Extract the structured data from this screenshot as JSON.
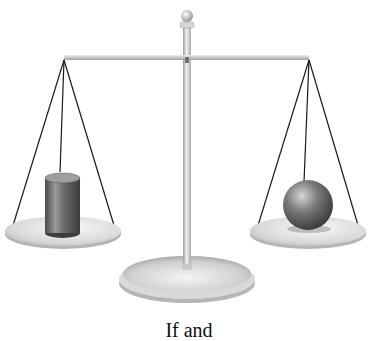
{
  "figure": {
    "left_pan": {
      "object": "cylinder"
    },
    "right_pan": {
      "object": "sphere"
    },
    "beam_state": "balanced",
    "caption": "If and"
  },
  "colors": {
    "metal_light": "#e6e6e6",
    "metal_mid": "#bdbdbd",
    "metal_dark": "#8c8c8c",
    "string": "#1a1a1a",
    "object_dark": "#555555"
  }
}
